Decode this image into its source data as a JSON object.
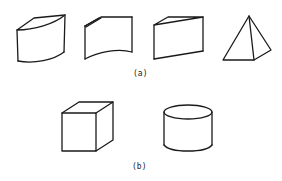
{
  "figure": {
    "row_a": {
      "caption": "(a)",
      "shapes": [
        "curved-block",
        "curved-sheet",
        "wedge",
        "pyramid"
      ]
    },
    "row_b": {
      "caption": "(b)",
      "shapes": [
        "cube",
        "cylinder"
      ]
    },
    "colors": {
      "line": "#1a1a1a",
      "background": "#ffffff"
    }
  }
}
